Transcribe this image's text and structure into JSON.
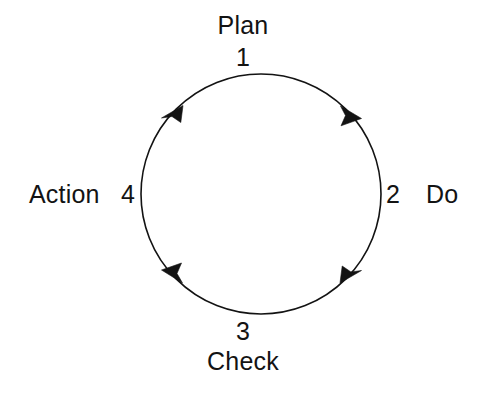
{
  "diagram": {
    "type": "pdca-cycle",
    "direction": "clockwise",
    "background_color": "#ffffff",
    "stroke_color": "#131313",
    "text_color": "#131313",
    "circle": {
      "center_x": 261,
      "center_y": 194,
      "radius": 120,
      "stroke_width": 1.6
    },
    "steps": [
      {
        "number": "1",
        "label": "Plan",
        "position": "top",
        "angle_deg": 270
      },
      {
        "number": "2",
        "label": "Do",
        "position": "right",
        "angle_deg": 0
      },
      {
        "number": "3",
        "label": "Check",
        "position": "bottom",
        "angle_deg": 90
      },
      {
        "number": "4",
        "label": "Action",
        "position": "left",
        "angle_deg": 180
      }
    ],
    "arrowheads": [
      {
        "name": "arrow-plan-to-do",
        "angle_deg": 315,
        "points": "clockwise"
      },
      {
        "name": "arrow-do-to-check",
        "angle_deg": 45,
        "points": "clockwise"
      },
      {
        "name": "arrow-check-to-action",
        "angle_deg": 135,
        "points": "clockwise"
      },
      {
        "name": "arrow-action-to-plan",
        "angle_deg": 225,
        "points": "clockwise"
      }
    ]
  }
}
